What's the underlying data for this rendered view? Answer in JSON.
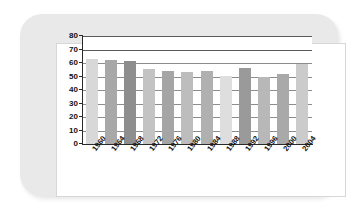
{
  "chart_data": {
    "type": "bar",
    "title": "",
    "xlabel": "",
    "ylabel": "% Voting Age Population",
    "ylim": [
      0,
      80
    ],
    "ytick_step": 10,
    "yticks": [
      80,
      70,
      60,
      50,
      40,
      30,
      20,
      10,
      0
    ],
    "grid": "horizontal",
    "legend": "none",
    "categories": [
      "1960",
      "1964",
      "1968",
      "1972",
      "1976",
      "1980",
      "1984",
      "1988",
      "1992",
      "1996",
      "2000",
      "2004"
    ],
    "values": [
      63,
      62.5,
      61.5,
      55.5,
      54,
      53,
      54,
      50.5,
      56,
      50,
      52,
      59.5
    ],
    "bar_colors": [
      "#d8d8d8",
      "#a8a8a8",
      "#8e8e8e",
      "#c3c3c3",
      "#a5a5a5",
      "#bdbdbd",
      "#b0b0b0",
      "#dedede",
      "#9a9a9a",
      "#b8b8b8",
      "#a9a9a9",
      "#cbcbcb"
    ]
  },
  "figure": {
    "card_background": "#e9e9e9",
    "plot_background": "#ffffff",
    "axis_color": "#2a2a2a",
    "gridline_color": "#5a5a5a"
  }
}
